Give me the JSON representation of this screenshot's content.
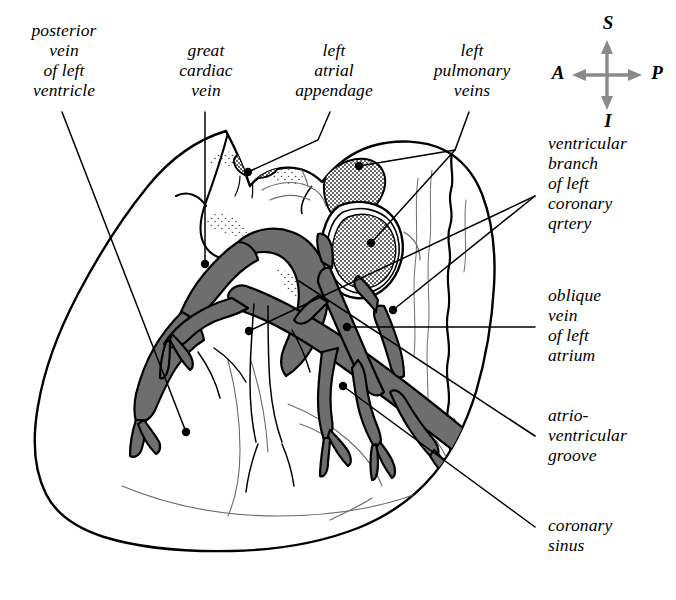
{
  "figure": {
    "background_color": "#ffffff",
    "ink_color": "#000000",
    "vessel_fill_color": "#6e6e6e",
    "stipple_color": "#2b2b2b",
    "compass_arrow_color": "#8a8a8a",
    "width": 676,
    "height": 600
  },
  "compass": {
    "superior": "S",
    "anterior": "A",
    "posterior": "P",
    "inferior": "I"
  },
  "labels": {
    "posterior_vein_of_left_ventricle": "posterior\nvein\nof left\nventricle",
    "great_cardiac_vein": "great\ncardiac\nvein",
    "left_atrial_appendage": "left\natrial\nappendage",
    "left_pulmonary_veins": "left\npulmonary\nveins",
    "ventricular_branch_of_left_coronary_artery": "ventricular\nbranch\nof left\ncoronary\nqrtery",
    "oblique_vein_of_left_atrium": "oblique\nvein\nof left\natrium",
    "atrioventricular_groove": "atrio-\nventricular\ngroove",
    "coronary_sinus": "coronary\nsinus"
  }
}
